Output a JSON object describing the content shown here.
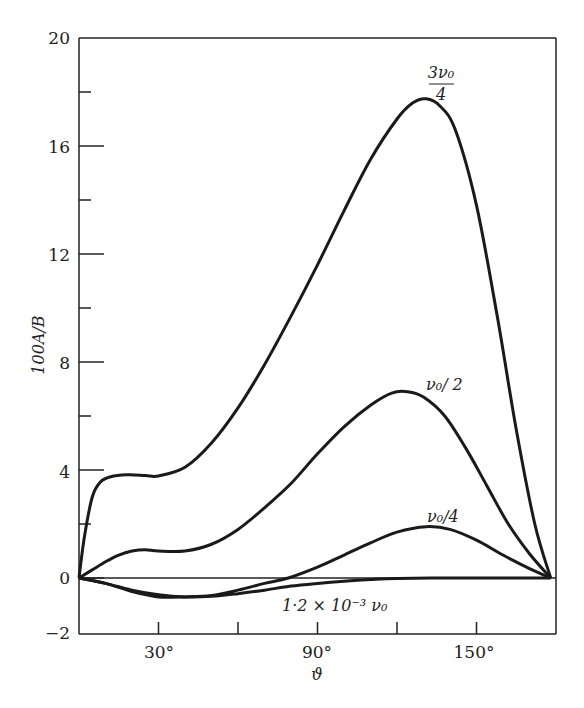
{
  "chart_data": {
    "type": "line",
    "title": "",
    "xlabel": "ϑ",
    "ylabel": "100A/B",
    "xlim": [
      0,
      180
    ],
    "ylim": [
      -2,
      20
    ],
    "grid": false,
    "legend": "inline curve labels",
    "x_ticks": [
      30,
      60,
      90,
      120,
      150
    ],
    "x_tick_labels": [
      "30°",
      "",
      "90°",
      "",
      "150°"
    ],
    "y_ticks": [
      -2,
      0,
      2,
      4,
      6,
      8,
      10,
      12,
      14,
      16,
      18,
      20
    ],
    "y_tick_labels": {
      "-2": "−2",
      "0": "0",
      "4": "4",
      "8": "8",
      "12": "12",
      "16": "16",
      "20": "20"
    },
    "series": [
      {
        "name": "3ν0/4",
        "label_lines": [
          "3ν₀",
          "4"
        ],
        "x": [
          0,
          2,
          5,
          8,
          12,
          18,
          25,
          30,
          40,
          50,
          60,
          70,
          80,
          90,
          100,
          110,
          120,
          126,
          131,
          136,
          142,
          150,
          158,
          165,
          172,
          178
        ],
        "values": [
          0,
          1.5,
          3.0,
          3.55,
          3.75,
          3.82,
          3.8,
          3.78,
          4.1,
          5.0,
          6.3,
          7.9,
          9.7,
          11.6,
          13.6,
          15.5,
          17.0,
          17.6,
          17.75,
          17.5,
          16.6,
          13.8,
          9.6,
          5.5,
          2.0,
          0
        ]
      },
      {
        "name": "ν0/2",
        "label": "ν₀/ 2",
        "x": [
          0,
          5,
          10,
          15,
          20,
          25,
          30,
          40,
          50,
          60,
          70,
          80,
          90,
          100,
          110,
          118,
          124,
          130,
          138,
          146,
          154,
          162,
          170,
          178
        ],
        "values": [
          0,
          0.3,
          0.6,
          0.85,
          1.0,
          1.05,
          1.0,
          1.0,
          1.25,
          1.8,
          2.6,
          3.5,
          4.6,
          5.6,
          6.4,
          6.85,
          6.9,
          6.7,
          6.0,
          4.8,
          3.4,
          2.0,
          0.9,
          0
        ]
      },
      {
        "name": "ν0/4",
        "label": "ν₀/4",
        "x": [
          0,
          10,
          20,
          30,
          40,
          50,
          60,
          70,
          79,
          90,
          100,
          110,
          120,
          131,
          140,
          150,
          160,
          170,
          178
        ],
        "values": [
          0,
          -0.2,
          -0.5,
          -0.7,
          -0.7,
          -0.65,
          -0.45,
          -0.2,
          0.0,
          0.4,
          0.85,
          1.3,
          1.7,
          1.9,
          1.8,
          1.4,
          0.85,
          0.35,
          0
        ]
      },
      {
        "name": "1.2×10^-3 ν0",
        "label": "1·2 × 10⁻³ ν₀",
        "x": [
          0,
          10,
          20,
          30,
          40,
          50,
          60,
          70,
          80,
          90,
          100,
          110,
          120,
          140,
          160,
          178
        ],
        "values": [
          0,
          -0.2,
          -0.45,
          -0.62,
          -0.7,
          -0.68,
          -0.58,
          -0.45,
          -0.3,
          -0.2,
          -0.12,
          -0.06,
          -0.02,
          0.0,
          0.0,
          0
        ]
      }
    ]
  },
  "axis": {
    "y_title": "100A/B",
    "x_title": "ϑ",
    "x_ticks": [
      {
        "label": "30°"
      },
      {
        "label": ""
      },
      {
        "label": "90°"
      },
      {
        "label": ""
      },
      {
        "label": "150°"
      }
    ],
    "y_ticks": [
      {
        "label": "20"
      },
      {
        "label": "16"
      },
      {
        "label": "12"
      },
      {
        "label": "8"
      },
      {
        "label": "4"
      },
      {
        "label": "0"
      },
      {
        "label": "−2"
      }
    ]
  },
  "labels": {
    "curve_3v0_4_num": "3ν₀",
    "curve_3v0_4_den": "4",
    "curve_v0_2": "ν₀/ 2",
    "curve_v0_4": "ν₀/4",
    "curve_small": "1·2 × 10⁻³ ν₀"
  }
}
